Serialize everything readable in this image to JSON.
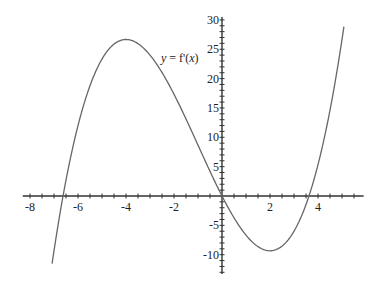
{
  "chart_data": {
    "type": "line",
    "title": "",
    "xlabel": "",
    "ylabel": "",
    "curve_label": {
      "var": "y",
      "eq": " = f'(",
      "arg": "x",
      "close": ")"
    },
    "function": "f'(x) = (x^3 + 3x^2 - 24x)/3",
    "xlim": [
      -8.3,
      5.9
    ],
    "ylim": [
      -13.3,
      30.5
    ],
    "x_ticks": [
      -8,
      -6,
      -4,
      -2,
      2,
      4
    ],
    "y_ticks": [
      -10,
      -5,
      5,
      10,
      15,
      20,
      25,
      30
    ],
    "x_minor_step": 0.5,
    "y_minor_step": 1,
    "grid": false,
    "series": [
      {
        "name": "y = f'(x)",
        "x": [
          -7.08,
          -6.62,
          -6,
          -5,
          -4,
          -3,
          -2,
          -1,
          0,
          1,
          2,
          3,
          3.62,
          4,
          5,
          5.08
        ],
        "y": [
          -11.5,
          0,
          12,
          23.3,
          26.7,
          24,
          17.3,
          8.7,
          0,
          -6.7,
          -9.3,
          -6,
          0,
          5.3,
          21.7,
          28.9
        ]
      }
    ],
    "key_points": {
      "local_max": {
        "x": -4,
        "y": 26.7
      },
      "local_min": {
        "x": 2,
        "y": -9.3
      },
      "zeros": [
        -6.62,
        0,
        3.62
      ]
    },
    "colors": {
      "axis": "#333333",
      "curve": "#666666",
      "text": "#222222"
    }
  }
}
